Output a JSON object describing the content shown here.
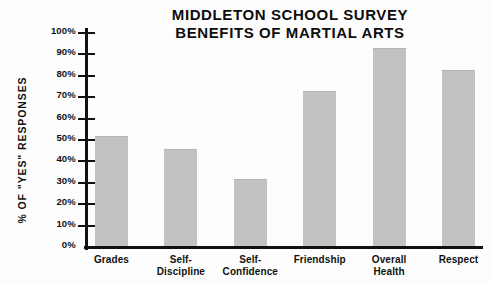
{
  "chart_data": {
    "type": "bar",
    "title": "MIDDLETON SCHOOL SURVEY",
    "subtitle": "BENEFITS OF MARTIAL ARTS",
    "xlabel": "",
    "ylabel": "% OF \"YES\" RESPONSES",
    "categories": [
      "Grades",
      "Self-Discipline",
      "Self-Confidence",
      "Friendship",
      "Overall Health",
      "Respect"
    ],
    "values": [
      51,
      45,
      31,
      72,
      92,
      82
    ],
    "ylim": [
      0,
      100
    ],
    "ytick_labels": [
      "100%",
      "90%",
      "80%",
      "70%",
      "60%",
      "50%",
      "40%",
      "30%",
      "20%",
      "10%",
      "0%"
    ],
    "ytick_values": [
      100,
      90,
      80,
      70,
      60,
      50,
      40,
      30,
      20,
      10,
      0
    ],
    "grid": false,
    "legend": false,
    "bar_color": "#c2c2c2",
    "axis_color": "#111111"
  },
  "categories_wrapped": [
    [
      "Grades"
    ],
    [
      "Self-",
      "Discipline"
    ],
    [
      "Self-",
      "Confidence"
    ],
    [
      "Friendship"
    ],
    [
      "Overall",
      "Health"
    ],
    [
      "Respect"
    ]
  ]
}
